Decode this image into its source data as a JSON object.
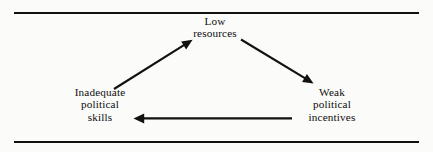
{
  "figure": {
    "background_color": "#fbfbfa",
    "ink_color": "#111111",
    "rules": {
      "top_label": "top-divider-rule",
      "bottom_label": "bottom-divider-rule"
    }
  },
  "diagram": {
    "type": "causal-loop",
    "nodes": [
      {
        "id": "low-resources",
        "position": "top-center",
        "lines": [
          "Low",
          "resources"
        ]
      },
      {
        "id": "inadequate-political-skills",
        "position": "bottom-left",
        "lines": [
          "Inadequate",
          "political",
          "skills"
        ]
      },
      {
        "id": "weak-political-incentives",
        "position": "bottom-right",
        "lines": [
          "Weak",
          "political",
          "incentives"
        ]
      }
    ],
    "arrows": [
      {
        "id": "skills-to-resources",
        "from": "inadequate-political-skills",
        "to": "low-resources",
        "direction": "up-right"
      },
      {
        "id": "resources-to-incentives",
        "from": "low-resources",
        "to": "weak-political-incentives",
        "direction": "down-right"
      },
      {
        "id": "incentives-to-skills",
        "from": "weak-political-incentives",
        "to": "inadequate-political-skills",
        "direction": "left"
      }
    ]
  }
}
